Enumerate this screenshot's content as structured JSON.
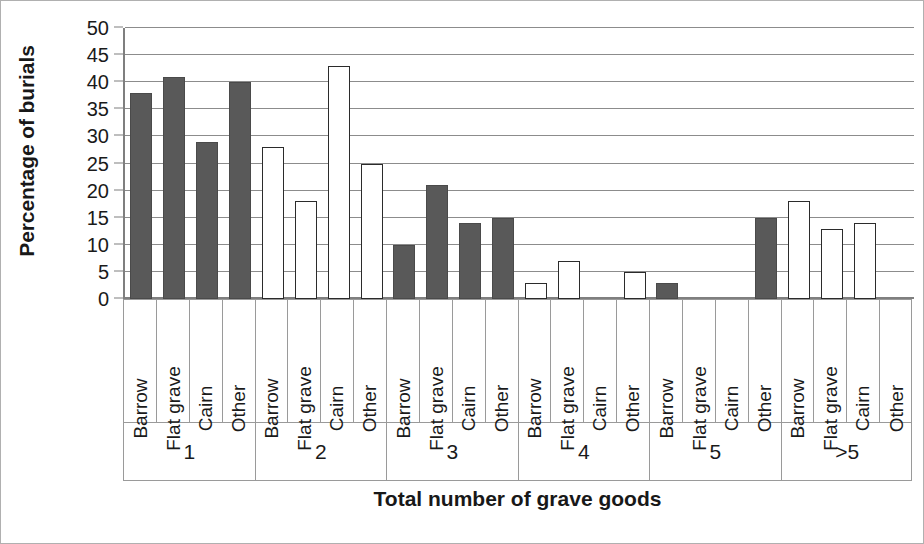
{
  "chart_data": {
    "type": "bar",
    "title": "",
    "xlabel": "Total number of grave goods",
    "ylabel": "Percentage of burials",
    "ylim": [
      0,
      50
    ],
    "yticks": [
      0,
      5,
      10,
      15,
      20,
      25,
      30,
      35,
      40,
      45,
      50
    ],
    "grid": true,
    "legend": "none",
    "categories": [
      "Barrow",
      "Flat grave",
      "Cairn",
      "Other"
    ],
    "groups": [
      "1",
      "2",
      "3",
      "4",
      "5",
      ">5"
    ],
    "colors": {
      "dark_fill": "#595959",
      "light_fill": "#ffffff",
      "bar_outline": "#2b2b2b",
      "gridline": "#8c8c8c",
      "axis": "#7f7f7f",
      "text": "#1a1a1a"
    },
    "bars": [
      {
        "group": "1",
        "category": "Barrow",
        "value": 38,
        "fill": "dark"
      },
      {
        "group": "1",
        "category": "Flat grave",
        "value": 41,
        "fill": "dark"
      },
      {
        "group": "1",
        "category": "Cairn",
        "value": 29,
        "fill": "dark"
      },
      {
        "group": "1",
        "category": "Other",
        "value": 40,
        "fill": "dark"
      },
      {
        "group": "2",
        "category": "Barrow",
        "value": 28,
        "fill": "light"
      },
      {
        "group": "2",
        "category": "Flat grave",
        "value": 18,
        "fill": "light"
      },
      {
        "group": "2",
        "category": "Cairn",
        "value": 43,
        "fill": "light"
      },
      {
        "group": "2",
        "category": "Other",
        "value": 25,
        "fill": "light"
      },
      {
        "group": "3",
        "category": "Barrow",
        "value": 10,
        "fill": "dark"
      },
      {
        "group": "3",
        "category": "Flat grave",
        "value": 21,
        "fill": "dark"
      },
      {
        "group": "3",
        "category": "Cairn",
        "value": 14,
        "fill": "dark"
      },
      {
        "group": "3",
        "category": "Other",
        "value": 15,
        "fill": "dark"
      },
      {
        "group": "4",
        "category": "Barrow",
        "value": 3,
        "fill": "light"
      },
      {
        "group": "4",
        "category": "Flat grave",
        "value": 7,
        "fill": "light"
      },
      {
        "group": "4",
        "category": "Cairn",
        "value": 0,
        "fill": "light"
      },
      {
        "group": "4",
        "category": "Other",
        "value": 5,
        "fill": "light"
      },
      {
        "group": "5",
        "category": "Barrow",
        "value": 3,
        "fill": "dark"
      },
      {
        "group": "5",
        "category": "Flat grave",
        "value": 0,
        "fill": "dark"
      },
      {
        "group": "5",
        "category": "Cairn",
        "value": 0,
        "fill": "dark"
      },
      {
        "group": "5",
        "category": "Other",
        "value": 15,
        "fill": "dark"
      },
      {
        "group": ">5",
        "category": "Barrow",
        "value": 18,
        "fill": "light"
      },
      {
        "group": ">5",
        "category": "Flat grave",
        "value": 13,
        "fill": "light"
      },
      {
        "group": ">5",
        "category": "Cairn",
        "value": 14,
        "fill": "light"
      },
      {
        "group": ">5",
        "category": "Other",
        "value": 0,
        "fill": "light"
      }
    ]
  }
}
